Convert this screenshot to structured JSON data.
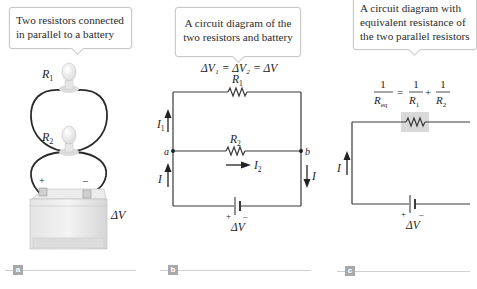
{
  "panels": [
    {
      "tag": "a",
      "caption": [
        "Two resistors connected",
        "in parallel to a battery"
      ],
      "labels": {
        "r1": "R",
        "r1_sub": "1",
        "r2": "R",
        "r2_sub": "2",
        "dv": "ΔV",
        "plus": "+",
        "minus": "–"
      }
    },
    {
      "tag": "b",
      "caption": [
        "A circuit diagram of the",
        "two resistors and battery"
      ],
      "equation": "ΔV₁ = ΔV₂ = ΔV",
      "labels": {
        "r1": "R",
        "r1_sub": "1",
        "r2": "R",
        "r2_sub": "2",
        "i1": "I",
        "i1_sub": "1",
        "i2": "I",
        "i2_sub": "2",
        "i_left": "I",
        "i_right": "I",
        "node_a": "a",
        "node_b": "b",
        "plus": "+",
        "minus": "–",
        "dv": "ΔV"
      }
    },
    {
      "tag": "c",
      "caption": [
        "A circuit diagram with",
        "equivalent resistance of",
        "the two parallel resistors"
      ],
      "equation": {
        "lhs_num": "1",
        "lhs_den": "R",
        "lhs_den_sub": "eq",
        "t1_num": "1",
        "t1_den": "R",
        "t1_den_sub": "1",
        "t2_num": "1",
        "t2_den": "R",
        "t2_den_sub": "2",
        "equals": "=",
        "plus": "+"
      },
      "labels": {
        "i": "I",
        "plus": "+",
        "minus": "–",
        "dv": "ΔV"
      }
    }
  ],
  "colors": {
    "wire": "#3a3a3a",
    "highlight": "#d9d9d9",
    "tag_bg": "#a9a9a9",
    "rule": "#cfcfcf"
  }
}
